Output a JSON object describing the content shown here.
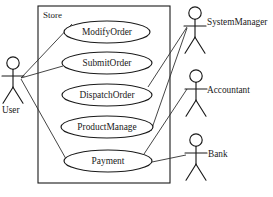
{
  "diagram": {
    "type": "uml-use-case-diagram",
    "background_color": "#ffffff",
    "stroke_color": "#1a1a1a",
    "boundary": {
      "label": "Store",
      "x": 38,
      "y": 6,
      "width": 132,
      "height": 177
    },
    "use_cases": [
      {
        "id": "modify-order",
        "label": "ModifyOrder",
        "cx": 107,
        "cy": 32,
        "rx": 43,
        "ry": 11
      },
      {
        "id": "submit-order",
        "label": "SubmitOrder",
        "cx": 107,
        "cy": 63,
        "rx": 45,
        "ry": 11
      },
      {
        "id": "dispatch-order",
        "label": "DispatchOrder",
        "cx": 107,
        "cy": 95,
        "rx": 45,
        "ry": 11
      },
      {
        "id": "product-manage",
        "label": "ProductManage",
        "cx": 107,
        "cy": 127,
        "rx": 46,
        "ry": 11
      },
      {
        "id": "payment",
        "label": "Payment",
        "cx": 108,
        "cy": 161,
        "rx": 44,
        "ry": 11
      }
    ],
    "actors": [
      {
        "id": "user",
        "label": "User",
        "head_cx": 13,
        "head_cy": 63,
        "label_x": 2,
        "label_y": 111,
        "label_anchor": "start"
      },
      {
        "id": "system-manager",
        "label": "SystemManager",
        "head_cx": 195,
        "head_cy": 13,
        "label_x": 207,
        "label_y": 23,
        "label_anchor": "start"
      },
      {
        "id": "accountant",
        "label": "Accountant",
        "head_cx": 196,
        "head_cy": 76,
        "label_x": 207,
        "label_y": 91,
        "label_anchor": "start"
      },
      {
        "id": "bank",
        "label": "Bank",
        "head_cx": 196,
        "head_cy": 140,
        "label_x": 208,
        "label_y": 155,
        "label_anchor": "start"
      }
    ],
    "associations": [
      {
        "id": "user-modify-order",
        "from": "user",
        "to": "modify-order",
        "x1": 21,
        "y1": 78,
        "x2": 72,
        "y2": 24
      },
      {
        "id": "user-submit-order",
        "from": "user",
        "to": "submit-order",
        "x1": 21,
        "y1": 78,
        "x2": 63,
        "y2": 66
      },
      {
        "id": "user-payment",
        "from": "user",
        "to": "payment",
        "x1": 21,
        "y1": 79,
        "x2": 70,
        "y2": 166
      },
      {
        "id": "system-manager-dispatch-order",
        "from": "system-manager",
        "to": "dispatch-order",
        "x1": 187,
        "y1": 27,
        "x2": 148,
        "y2": 87
      },
      {
        "id": "system-manager-product-manage",
        "from": "system-manager",
        "to": "product-manage",
        "x1": 187,
        "y1": 28,
        "x2": 151,
        "y2": 131
      },
      {
        "id": "accountant-payment",
        "from": "accountant",
        "to": "payment",
        "x1": 187,
        "y1": 89,
        "x2": 144,
        "y2": 154
      },
      {
        "id": "bank-payment",
        "from": "bank",
        "to": "payment",
        "x1": 186,
        "y1": 155,
        "x2": 152,
        "y2": 162
      }
    ]
  }
}
